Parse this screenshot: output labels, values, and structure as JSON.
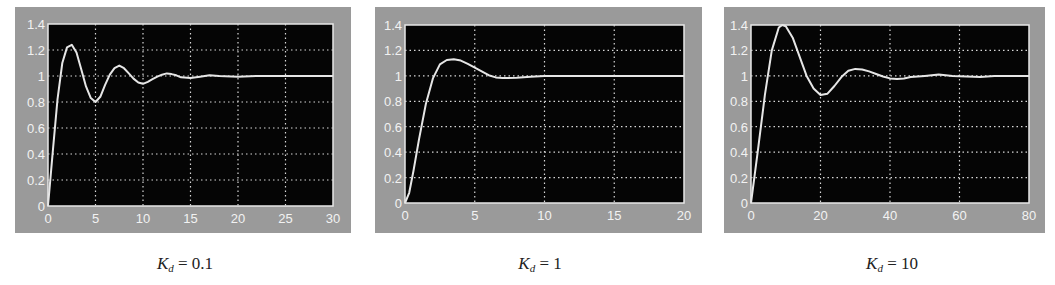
{
  "figure": {
    "background": "#ffffff",
    "frame_color": "#9a9a9a",
    "plot_bg": "#050505",
    "line_color": "#e6e6e6",
    "grid_color": "#d8d8d8",
    "tick_label_color": "#f2f2f2"
  },
  "chart_data": [
    {
      "type": "line",
      "title": "",
      "caption": {
        "var": "K",
        "sub": "d",
        "rest": " = 0.1"
      },
      "xlabel": "",
      "ylabel": "",
      "xlim": [
        0,
        30
      ],
      "ylim": [
        0,
        1.4
      ],
      "xticks": [
        0,
        5,
        10,
        15,
        20,
        25,
        30
      ],
      "yticks": [
        0,
        0.2,
        0.4,
        0.6,
        0.8,
        1,
        1.2,
        1.4
      ],
      "grid": true,
      "series": [
        {
          "name": "step response",
          "x": [
            0,
            0.5,
            1,
            1.5,
            2,
            2.5,
            3,
            3.5,
            4,
            4.5,
            5,
            5.5,
            6,
            6.5,
            7,
            7.5,
            8,
            8.5,
            9,
            9.5,
            10,
            10.5,
            11,
            11.5,
            12,
            12.5,
            13,
            13.5,
            14,
            15,
            16,
            17,
            18,
            20,
            22,
            25,
            30
          ],
          "y": [
            0,
            0.42,
            0.82,
            1.1,
            1.22,
            1.24,
            1.18,
            1.05,
            0.92,
            0.83,
            0.8,
            0.84,
            0.93,
            1.01,
            1.06,
            1.08,
            1.06,
            1.02,
            0.98,
            0.95,
            0.94,
            0.955,
            0.975,
            0.995,
            1.01,
            1.02,
            1.015,
            1.005,
            0.99,
            0.985,
            0.995,
            1.005,
            1.0,
            0.995,
            1.0,
            1.0,
            1.0
          ]
        }
      ]
    },
    {
      "type": "line",
      "title": "",
      "caption": {
        "var": "K",
        "sub": "d",
        "rest": " = 1"
      },
      "xlabel": "",
      "ylabel": "",
      "xlim": [
        0,
        20
      ],
      "ylim": [
        0,
        1.4
      ],
      "xticks": [
        0,
        5,
        10,
        15,
        20
      ],
      "yticks": [
        0,
        0.2,
        0.4,
        0.6,
        0.8,
        1,
        1.2,
        1.4
      ],
      "grid": true,
      "series": [
        {
          "name": "step response",
          "x": [
            0,
            0.3,
            0.6,
            1,
            1.5,
            2,
            2.5,
            3,
            3.5,
            4,
            4.5,
            5,
            5.5,
            6,
            6.5,
            7,
            8,
            9,
            10,
            12,
            15,
            20
          ],
          "y": [
            0,
            0.08,
            0.25,
            0.5,
            0.78,
            0.98,
            1.09,
            1.125,
            1.13,
            1.12,
            1.095,
            1.065,
            1.035,
            1.005,
            0.988,
            0.983,
            0.985,
            0.993,
            1.0,
            1.0,
            1.0,
            1.0
          ]
        }
      ]
    },
    {
      "type": "line",
      "title": "",
      "caption": {
        "var": "K",
        "sub": "d",
        "rest": " = 10"
      },
      "xlabel": "",
      "ylabel": "",
      "xlim": [
        0,
        80
      ],
      "ylim": [
        0,
        1.4
      ],
      "xticks": [
        0,
        20,
        40,
        60,
        80
      ],
      "yticks": [
        0,
        0.2,
        0.4,
        0.6,
        0.8,
        1,
        1.2,
        1.4
      ],
      "grid": true,
      "series": [
        {
          "name": "step response",
          "x": [
            0,
            2,
            4,
            6,
            8,
            9,
            10,
            12,
            14,
            16,
            18,
            20,
            22,
            24,
            26,
            28,
            30,
            32,
            34,
            36,
            38,
            40,
            42,
            44,
            46,
            50,
            54,
            58,
            62,
            66,
            70,
            80
          ],
          "y": [
            0,
            0.42,
            0.85,
            1.2,
            1.38,
            1.4,
            1.39,
            1.3,
            1.15,
            1.0,
            0.9,
            0.85,
            0.86,
            0.92,
            0.99,
            1.04,
            1.055,
            1.05,
            1.035,
            1.015,
            0.995,
            0.98,
            0.975,
            0.98,
            0.99,
            1.0,
            1.01,
            1.0,
            0.995,
            0.99,
            1.0,
            1.0
          ]
        }
      ]
    }
  ],
  "panels": [
    {
      "left": 15,
      "width": 336,
      "plot": {
        "x": 33,
        "y": 17,
        "w": 285,
        "h": 182
      },
      "caption_x": 185
    },
    {
      "left": 375,
      "width": 327,
      "plot": {
        "x": 30,
        "y": 18,
        "w": 279,
        "h": 178
      },
      "caption_x": 540
    },
    {
      "left": 724,
      "width": 321,
      "plot": {
        "x": 27,
        "y": 18,
        "w": 278,
        "h": 178
      },
      "caption_x": 892
    }
  ]
}
